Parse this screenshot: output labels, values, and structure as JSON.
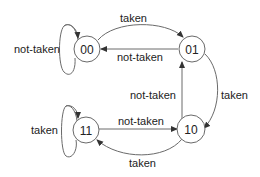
{
  "diagram": {
    "type": "state-machine",
    "states": [
      {
        "id": "00",
        "label": "00"
      },
      {
        "id": "01",
        "label": "01"
      },
      {
        "id": "10",
        "label": "10"
      },
      {
        "id": "11",
        "label": "11"
      }
    ],
    "transitions": [
      {
        "from": "00",
        "to": "00",
        "label": "not-taken"
      },
      {
        "from": "00",
        "to": "01",
        "label": "taken"
      },
      {
        "from": "01",
        "to": "00",
        "label": "not-taken"
      },
      {
        "from": "01",
        "to": "10",
        "label": "taken"
      },
      {
        "from": "10",
        "to": "01",
        "label": "not-taken"
      },
      {
        "from": "10",
        "to": "11",
        "label": "taken"
      },
      {
        "from": "11",
        "to": "10",
        "label": "not-taken"
      },
      {
        "from": "11",
        "to": "11",
        "label": "taken"
      }
    ]
  }
}
